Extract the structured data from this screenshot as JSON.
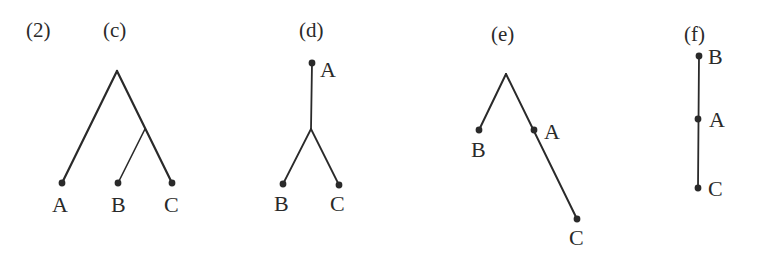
{
  "figure": {
    "number_label": "(2)",
    "panels": [
      {
        "id": "c",
        "label": "(c)",
        "nodes": [
          {
            "name": "A",
            "x": 62,
            "y": 183
          },
          {
            "name": "B",
            "x": 118,
            "y": 183
          },
          {
            "name": "C",
            "x": 172,
            "y": 183
          }
        ],
        "structure": "rooted tree: A splits first; B and C are sister taxa"
      },
      {
        "id": "d",
        "label": "(d)",
        "nodes": [
          {
            "name": "A",
            "x": 312,
            "y": 63
          },
          {
            "name": "B",
            "x": 283,
            "y": 184
          },
          {
            "name": "C",
            "x": 339,
            "y": 185
          }
        ],
        "structure": "A connected to internal node which branches to B and C"
      },
      {
        "id": "e",
        "label": "(e)",
        "nodes": [
          {
            "name": "B",
            "x": 479,
            "y": 130
          },
          {
            "name": "A",
            "x": 534,
            "y": 130
          },
          {
            "name": "C",
            "x": 577,
            "y": 219
          }
        ],
        "structure": "apex with B on left branch; A lies on right branch leading to C"
      },
      {
        "id": "f",
        "label": "(f)",
        "nodes": [
          {
            "name": "B",
            "x": 699,
            "y": 56
          },
          {
            "name": "A",
            "x": 698,
            "y": 119
          },
          {
            "name": "C",
            "x": 698,
            "y": 188
          }
        ],
        "structure": "linear chain B - A - C"
      }
    ]
  }
}
